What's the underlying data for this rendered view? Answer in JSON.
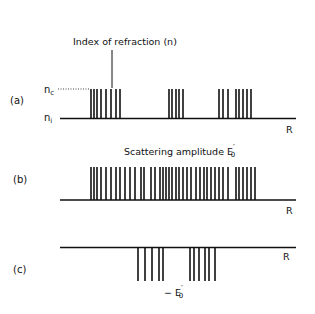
{
  "figure": {
    "ink_color": "#111111",
    "background": "#ffffff"
  },
  "panel_a": {
    "label": "(a)",
    "title": "Index of refraction (n)",
    "level_high": "n",
    "level_high_sub": "c",
    "level_low": "n",
    "level_low_sub": "i",
    "axis_label": "R",
    "bars_x": [
      91,
      94,
      97,
      101,
      106,
      111,
      116,
      120,
      169,
      172,
      176,
      179,
      183,
      219,
      223,
      228,
      236,
      239,
      243,
      247,
      251
    ]
  },
  "panel_b": {
    "label": "(b)",
    "title": "Scattering amplitude E",
    "title_sup": "′",
    "title_sub": "0",
    "axis_label": "R",
    "bars_x": [
      91,
      94,
      97,
      101,
      106,
      111,
      116,
      120,
      125,
      130,
      135,
      141,
      144,
      151,
      155,
      160,
      163,
      166,
      169,
      172,
      176,
      179,
      183,
      187,
      191,
      196,
      200,
      204,
      207,
      211,
      215,
      219,
      223,
      228,
      236,
      239,
      243,
      247,
      251,
      255
    ]
  },
  "panel_c": {
    "label": "(c)",
    "axis_label": "R",
    "bottom_label": "− E",
    "bottom_label_sup": "′",
    "bottom_label_sub": "0",
    "bars_x": [
      138,
      145,
      152,
      159,
      163,
      190,
      194,
      199,
      205,
      209,
      215
    ]
  },
  "chart_data": {
    "type": "diagram",
    "panels": [
      {
        "id": "a",
        "title": "Index of refraction (n)",
        "levels": [
          "n_c",
          "n_i"
        ],
        "x_axis": "R",
        "bar_count": 21,
        "groups": [
          8,
          5,
          8
        ]
      },
      {
        "id": "b",
        "title": "Scattering amplitude E'_0",
        "x_axis": "R",
        "bar_count": 40
      },
      {
        "id": "c",
        "title": "-E'_0",
        "x_axis": "R",
        "bar_count": 11,
        "direction": "negative",
        "groups": [
          5,
          6
        ]
      }
    ]
  }
}
